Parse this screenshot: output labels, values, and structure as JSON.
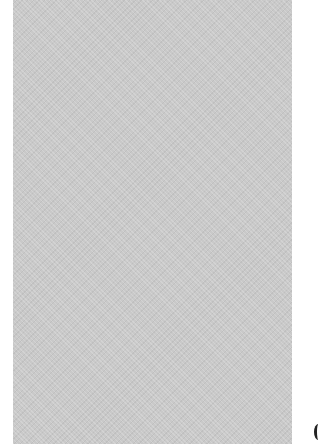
{
  "image": {
    "description": "Gray textured fabric swatch on white background",
    "swatch_color": "#c9c9c9",
    "background_color": "#ffffff"
  }
}
